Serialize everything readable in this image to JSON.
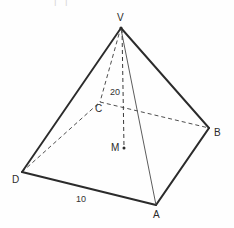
{
  "figure": {
    "name": "square-pyramid-diagram",
    "type": "geometry-diagram",
    "shape": "square pyramid",
    "background_color": "#fefefe",
    "stroke_color": "#2b2b2b",
    "width": 234,
    "height": 228
  },
  "top_fragment": {
    "text": "I I"
  },
  "labels": {
    "apex": "V",
    "base_front_right": "A",
    "base_right": "B",
    "base_back": "C",
    "base_left": "D",
    "center": "M"
  },
  "dimensions": {
    "height_label": "20",
    "base_edge_label": "10"
  },
  "vertices": {
    "V": {
      "x": 121,
      "y": 27
    },
    "A": {
      "x": 156,
      "y": 205
    },
    "B": {
      "x": 209,
      "y": 128
    },
    "C": {
      "x": 100,
      "y": 102
    },
    "D": {
      "x": 22,
      "y": 172
    },
    "M": {
      "x": 124,
      "y": 148
    }
  },
  "edges": [
    {
      "name": "edge-V-D",
      "from": "V",
      "to": "D",
      "style": "solid",
      "weight": "heavy"
    },
    {
      "name": "edge-V-B",
      "from": "V",
      "to": "B",
      "style": "solid",
      "weight": "heavy"
    },
    {
      "name": "edge-V-A",
      "from": "V",
      "to": "A",
      "style": "solid",
      "weight": "light"
    },
    {
      "name": "edge-V-C",
      "from": "V",
      "to": "C",
      "style": "dashed",
      "weight": "light"
    },
    {
      "name": "edge-D-A",
      "from": "D",
      "to": "A",
      "style": "solid",
      "weight": "heavy"
    },
    {
      "name": "edge-A-B",
      "from": "A",
      "to": "B",
      "style": "solid",
      "weight": "heavy"
    },
    {
      "name": "edge-D-C",
      "from": "D",
      "to": "C",
      "style": "dashed",
      "weight": "light"
    },
    {
      "name": "edge-C-B",
      "from": "C",
      "to": "B",
      "style": "dashed",
      "weight": "light"
    },
    {
      "name": "altitude-V-M",
      "from": "V",
      "to": "M",
      "style": "dashed",
      "weight": "light"
    }
  ]
}
